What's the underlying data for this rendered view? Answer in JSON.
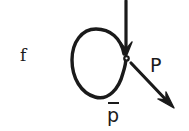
{
  "figure": {
    "kind": "hand-drawn-physics-diagram",
    "background_color": "#ffffff",
    "ink_color": "#1a1a1a",
    "width": 189,
    "height": 131
  },
  "labels": {
    "fermion": "f",
    "momentum": "P",
    "antiproton": "p",
    "antiproton_overbar": true
  },
  "elements": {
    "loop_name": "closed loop",
    "incoming_arrow_name": "incoming vertical arrow",
    "outgoing_arrow_name": "outgoing diagonal arrow",
    "vertex_name": "interaction vertex dot"
  },
  "geometry": {
    "loop_center": [
      98,
      64
    ],
    "loop_rx": 26,
    "loop_ry": 34,
    "vertex_point": [
      126,
      58
    ],
    "incoming_arrow_start": [
      126,
      1
    ],
    "incoming_arrow_end": [
      126,
      55
    ],
    "outgoing_arrow_start": [
      131,
      62
    ],
    "outgoing_arrow_end": [
      174,
      108
    ]
  }
}
